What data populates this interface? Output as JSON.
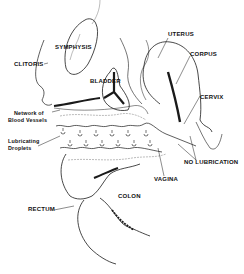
{
  "diagram": {
    "colors": {
      "ink": "#1a1a1a",
      "background": "#ffffff"
    },
    "labels": {
      "symphysis": "SYMPHYSIS",
      "clitoris": "CLITORIS",
      "bladder": "BLADDER",
      "network_line1": "Network of",
      "network_line2": "Blood Vessels",
      "lubricating_line1": "Lubricating",
      "lubricating_line2": "Droplets",
      "uterus": "UTERUS",
      "corpus": "CORPUS",
      "cervix": "CERVIX",
      "no_lubrication": "NO LUBRICATION",
      "vagina": "VAGINA",
      "colon": "COLON",
      "rectum": "RECTUM"
    }
  }
}
